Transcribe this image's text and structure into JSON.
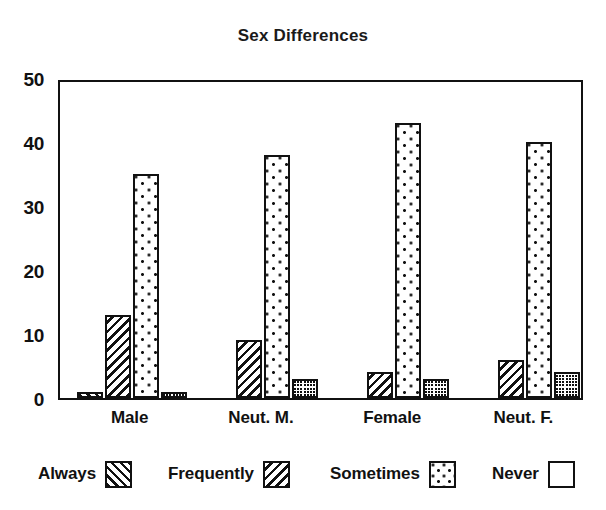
{
  "chart_data": {
    "type": "bar",
    "title": "Sex Differences",
    "xlabel": "",
    "ylabel": "",
    "ylim": [
      0,
      50
    ],
    "yticks": [
      0,
      10,
      20,
      30,
      40,
      50
    ],
    "ytick_labels": [
      "0",
      "10",
      "20",
      "30",
      "40",
      "50"
    ],
    "grid": false,
    "legend_position": "bottom",
    "categories": [
      "Male",
      "Neut. M.",
      "Female",
      "Neut. F."
    ],
    "series": [
      {
        "name": "Always",
        "pattern": "forward-diagonal-hatch",
        "values": [
          1,
          0,
          0,
          0
        ]
      },
      {
        "name": "Frequently",
        "pattern": "backward-diagonal-hatch",
        "values": [
          13,
          9,
          4,
          6
        ]
      },
      {
        "name": "Sometimes",
        "pattern": "sparse-dots",
        "values": [
          35,
          38,
          43,
          40
        ]
      },
      {
        "name": "Never",
        "pattern": "dense-crosshatch",
        "values": [
          1,
          3,
          3,
          4
        ]
      }
    ],
    "colors": {
      "ink": "#111111",
      "background": "#ffffff"
    }
  },
  "legend": {
    "entries": [
      {
        "label": "Always"
      },
      {
        "label": "Frequently"
      },
      {
        "label": "Sometimes"
      },
      {
        "label": "Never"
      }
    ]
  }
}
